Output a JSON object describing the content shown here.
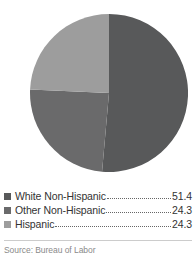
{
  "chart_data": {
    "type": "pie",
    "title": "",
    "subtitle": "",
    "xlabel": "",
    "ylabel": "",
    "categories": [
      "White Non-Hispanic",
      "Other Non-Hispanic",
      "Hispanic"
    ],
    "values": [
      51.4,
      24.3,
      24.3
    ],
    "value_labels": [
      "51.4",
      "24.3",
      "24.3"
    ],
    "colors": [
      "#58595a",
      "#6a6a6b",
      "#9d9d9d"
    ],
    "legend_position": "bottom",
    "grid": false,
    "start_angle_deg": 0,
    "direction": "clockwise",
    "units": "percent"
  },
  "legend": {
    "items": [
      {
        "label": "White Non-Hispanic",
        "value": "51.4",
        "color": "#58595a",
        "swatch_name": "legend-swatch-white-non-hispanic"
      },
      {
        "label": "Other Non-Hispanic",
        "value": "24.3",
        "color": "#6a6a6b",
        "swatch_name": "legend-swatch-other-non-hispanic"
      },
      {
        "label": "Hispanic",
        "value": "24.3",
        "color": "#9d9d9d",
        "swatch_name": "legend-swatch-hispanic"
      }
    ]
  },
  "footer": {
    "source": "Source: Bureau of Labor"
  }
}
